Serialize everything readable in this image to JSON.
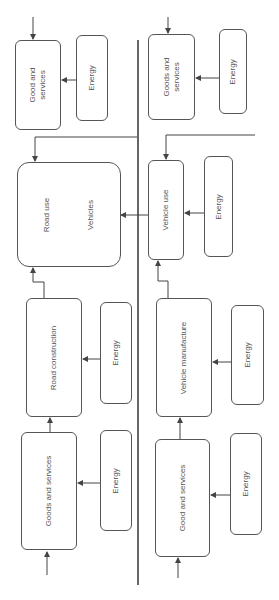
{
  "diagram": {
    "orientation": "rotated-90-ccw",
    "colors": {
      "line": "#444444",
      "box_border": "#555555",
      "text": "#555555",
      "divider": "#333333"
    },
    "left_chain": {
      "goods_top": {
        "label": "Good and\nservices"
      },
      "energy_top": {
        "label": "Energy"
      },
      "road_use": {
        "label": "Road use",
        "sub_label": "Vehicles"
      },
      "road_construction": {
        "label": "Road construction"
      },
      "energy_rc": {
        "label": "Energy"
      },
      "goods_bottom": {
        "label": "Goods and services"
      },
      "energy_bottom": {
        "label": "Energy"
      }
    },
    "right_chain": {
      "goods_top": {
        "label": "Goods and\nservices"
      },
      "energy_top": {
        "label": "Energy"
      },
      "vehicle_use": {
        "label": "Vehicle use"
      },
      "energy_vu": {
        "label": "Energy"
      },
      "vehicle_manufacture": {
        "label": "Vehicle manufacture"
      },
      "energy_vm": {
        "label": "Energy"
      },
      "goods_bottom": {
        "label": "Good and services"
      },
      "energy_bottom": {
        "label": "Energy"
      }
    }
  }
}
